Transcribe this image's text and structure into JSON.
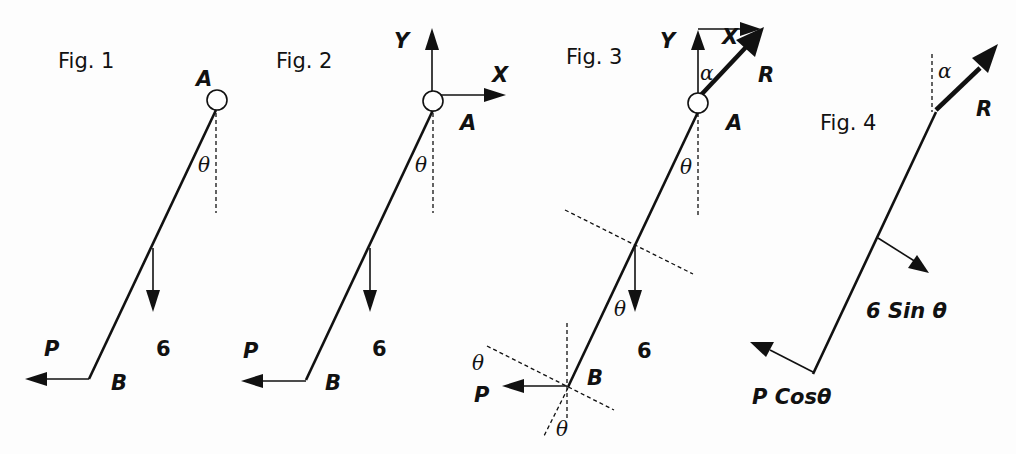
{
  "figures": [
    {
      "id": "fig1",
      "title": "Fig. 1",
      "labels": {
        "pin": "A",
        "end": "B",
        "force": "P",
        "weight": "6",
        "angle": "θ"
      }
    },
    {
      "id": "fig2",
      "title": "Fig. 2",
      "labels": {
        "pin": "A",
        "end": "B",
        "force": "P",
        "weight": "6",
        "angle": "θ",
        "x_axis": "X",
        "y_axis": "Y"
      }
    },
    {
      "id": "fig3",
      "title": "Fig. 3",
      "labels": {
        "pin": "A",
        "end": "B",
        "force": "P",
        "weight": "6",
        "angle_top": "θ",
        "angle_weight": "θ",
        "angle_p": "θ",
        "angle_bottom": "θ",
        "x_axis": "X",
        "y_axis": "Y",
        "reaction": "R",
        "reaction_angle": "α"
      }
    },
    {
      "id": "fig4",
      "title": "Fig. 4",
      "labels": {
        "reaction": "R",
        "reaction_angle": "α",
        "weight_component": "6 Sin θ",
        "force_component": "P Cosθ"
      }
    }
  ]
}
